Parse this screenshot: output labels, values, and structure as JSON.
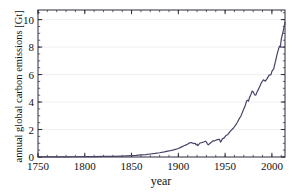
{
  "chart_data": {
    "type": "line",
    "title": "",
    "xlabel": "year",
    "ylabel": "annual global carbon emissions [Gt]",
    "xlim": [
      1750,
      2014
    ],
    "ylim": [
      0,
      10.7
    ],
    "xticks": [
      1750,
      1800,
      1850,
      1900,
      1950,
      2000
    ],
    "yticks": [
      0,
      2,
      4,
      6,
      8,
      10
    ],
    "xtick_labels": [
      "1750",
      "1800",
      "1850",
      "1900",
      "1950",
      "2000"
    ],
    "ytick_labels": [
      "0",
      "2",
      "4",
      "6",
      "8",
      "10"
    ],
    "x_minor_step": 10,
    "y_minor_step": 0.5,
    "grid": "horizontal-major-only",
    "legend": "none",
    "line_color": "#4a4268",
    "line_width": 1.2,
    "series": [
      {
        "name": "annual global carbon emissions",
        "x": [
          1750,
          1760,
          1770,
          1780,
          1790,
          1800,
          1810,
          1820,
          1830,
          1840,
          1850,
          1855,
          1860,
          1865,
          1870,
          1875,
          1880,
          1885,
          1890,
          1895,
          1900,
          1903,
          1906,
          1909,
          1912,
          1914,
          1916,
          1918,
          1919,
          1920,
          1921,
          1923,
          1925,
          1927,
          1929,
          1930,
          1931,
          1932,
          1933,
          1935,
          1937,
          1939,
          1941,
          1943,
          1944,
          1945,
          1946,
          1947,
          1949,
          1951,
          1953,
          1955,
          1957,
          1959,
          1961,
          1963,
          1965,
          1967,
          1969,
          1971,
          1973,
          1974,
          1975,
          1976,
          1977,
          1979,
          1980,
          1981,
          1982,
          1983,
          1984,
          1985,
          1987,
          1989,
          1991,
          1992,
          1993,
          1995,
          1997,
          1999,
          2000,
          2002,
          2004,
          2006,
          2008,
          2009,
          2010,
          2012,
          2014
        ],
        "y": [
          0.01,
          0.01,
          0.01,
          0.01,
          0.02,
          0.03,
          0.03,
          0.04,
          0.05,
          0.07,
          0.1,
          0.12,
          0.15,
          0.18,
          0.22,
          0.26,
          0.31,
          0.37,
          0.44,
          0.52,
          0.62,
          0.72,
          0.82,
          0.9,
          1.03,
          1.05,
          0.98,
          1.0,
          0.88,
          0.94,
          0.82,
          1.02,
          1.05,
          1.09,
          1.15,
          1.08,
          0.96,
          0.89,
          0.94,
          1.05,
          1.18,
          1.18,
          1.25,
          1.28,
          1.28,
          1.08,
          1.17,
          1.32,
          1.39,
          1.57,
          1.64,
          1.83,
          1.98,
          2.11,
          2.3,
          2.51,
          2.78,
          3.0,
          3.34,
          3.65,
          4.08,
          4.14,
          4.06,
          4.32,
          4.45,
          4.8,
          4.74,
          4.6,
          4.51,
          4.52,
          4.72,
          4.85,
          5.14,
          5.44,
          5.62,
          5.56,
          5.53,
          5.72,
          5.96,
          6.0,
          6.23,
          6.43,
          7.01,
          7.6,
          8.07,
          7.99,
          8.57,
          9.15,
          9.8
        ]
      }
    ]
  },
  "axes": {
    "xlabel_text": "year",
    "ylabel_text": "annual global carbon emissions [Gt]"
  }
}
